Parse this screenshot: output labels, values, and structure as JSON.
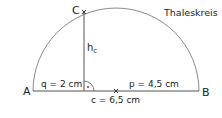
{
  "title": "Thaleskreis",
  "points": {
    "A": "A",
    "B": "B",
    "C": "C"
  },
  "labels": {
    "altitude": "h",
    "altitude_sub": "c",
    "q": "q = 2 cm",
    "p": "p = 4,5 cm",
    "c": "c = 6,5 cm"
  },
  "colors": {
    "line": "#555555",
    "arc": "#888888",
    "text": "#222222"
  }
}
